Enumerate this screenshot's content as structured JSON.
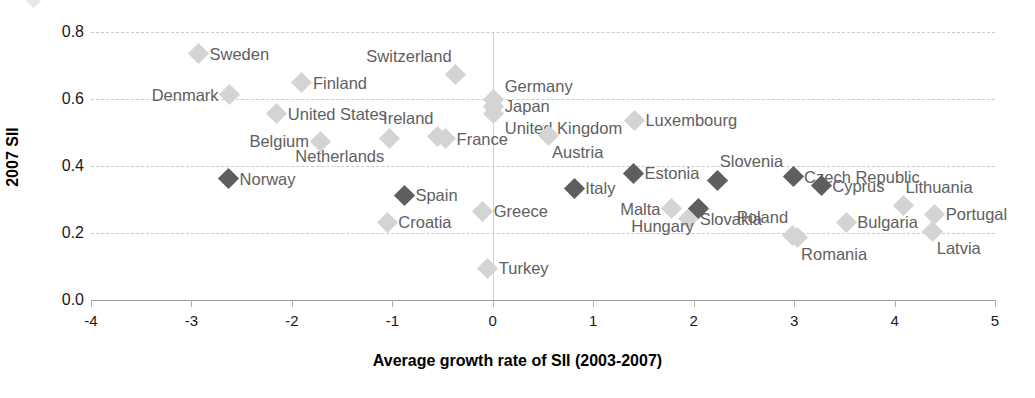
{
  "chart_data": {
    "type": "scatter",
    "title": "",
    "xlabel": "Average growth rate of SII (2003-2007)",
    "ylabel": "2007 SII",
    "xlim": [
      -4,
      5
    ],
    "ylim": [
      0.0,
      0.8
    ],
    "xticks": [
      "-4",
      "-3",
      "-2",
      "-1",
      "0",
      "1",
      "2",
      "3",
      "4",
      "5"
    ],
    "xtick_values": [
      -4,
      -3,
      -2,
      -1,
      0,
      1,
      2,
      3,
      4,
      5
    ],
    "yticks": [
      "0.0",
      "0.2",
      "0.4",
      "0.6",
      "0.8"
    ],
    "ytick_values": [
      0.0,
      0.2,
      0.4,
      0.6,
      0.8
    ],
    "grid": "horizontal-dashed",
    "legend": "none",
    "series": [
      {
        "name": "light-markers",
        "color": "#d4d4d4",
        "points": [
          {
            "label": "Sweden",
            "x": -2.93,
            "y": 0.735,
            "lbl_side": "right"
          },
          {
            "label": "Denmark",
            "x": -2.62,
            "y": 0.612,
            "lbl_side": "left"
          },
          {
            "label": "Finland",
            "x": -1.9,
            "y": 0.648,
            "lbl_side": "right"
          },
          {
            "label": "Switzerland",
            "x": -0.37,
            "y": 0.672,
            "lbl_side": "above-left"
          },
          {
            "label": "Germany",
            "x": 0.01,
            "y": 0.598,
            "lbl_side": "right-up"
          },
          {
            "label": "Japan",
            "x": 0.01,
            "y": 0.578,
            "lbl_side": "right"
          },
          {
            "label": "United Kingdom",
            "x": 0.01,
            "y": 0.558,
            "lbl_side": "right-down"
          },
          {
            "label": "United States",
            "x": -2.15,
            "y": 0.556,
            "lbl_side": "right"
          },
          {
            "label": "Ireland",
            "x": -0.55,
            "y": 0.487,
            "lbl_side": "above-left"
          },
          {
            "label": "France",
            "x": -0.47,
            "y": 0.482,
            "lbl_side": "right"
          },
          {
            "label": "Belgium",
            "x": -1.72,
            "y": 0.474,
            "lbl_side": "left"
          },
          {
            "label": "Netherlands",
            "x": -1.03,
            "y": 0.481,
            "lbl_side": "below-left"
          },
          {
            "label": "Austria",
            "x": 0.55,
            "y": 0.492,
            "lbl_side": "below-right"
          },
          {
            "label": "Luxembourg",
            "x": 1.41,
            "y": 0.536,
            "lbl_side": "right"
          },
          {
            "label": "Greece",
            "x": -0.1,
            "y": 0.265,
            "lbl_side": "right"
          },
          {
            "label": "Croatia",
            "x": -1.05,
            "y": 0.232,
            "lbl_side": "right"
          },
          {
            "label": "Turkey",
            "x": -0.05,
            "y": 0.095,
            "lbl_side": "right"
          },
          {
            "label": "Malta",
            "x": 1.78,
            "y": 0.272,
            "lbl_side": "left"
          },
          {
            "label": "Slovakia",
            "x": 1.95,
            "y": 0.243,
            "lbl_side": "right"
          },
          {
            "label": "Poland",
            "x": 2.98,
            "y": 0.192,
            "lbl_side": "above-left"
          },
          {
            "label": "Romania",
            "x": 3.03,
            "y": 0.188,
            "lbl_side": "below-right"
          },
          {
            "label": "Bulgaria",
            "x": 3.52,
            "y": 0.232,
            "lbl_side": "right"
          },
          {
            "label": "Lithuania",
            "x": 4.09,
            "y": 0.281,
            "lbl_side": "above-right"
          },
          {
            "label": "Portugal",
            "x": 4.4,
            "y": 0.256,
            "lbl_side": "right"
          },
          {
            "label": "Latvia",
            "x": 4.38,
            "y": 0.205,
            "lbl_side": "below-right"
          }
        ]
      },
      {
        "name": "dark-markers",
        "color": "#5e5e5e",
        "points": [
          {
            "label": "Norway",
            "x": -2.63,
            "y": 0.362,
            "lbl_side": "right"
          },
          {
            "label": "Spain",
            "x": -0.88,
            "y": 0.312,
            "lbl_side": "right"
          },
          {
            "label": "Italy",
            "x": 0.81,
            "y": 0.334,
            "lbl_side": "right"
          },
          {
            "label": "Estonia",
            "x": 1.4,
            "y": 0.378,
            "lbl_side": "right"
          },
          {
            "label": "Slovenia",
            "x": 2.24,
            "y": 0.357,
            "lbl_side": "above-right"
          },
          {
            "label": "Hungary",
            "x": 2.05,
            "y": 0.273,
            "lbl_side": "below-left"
          },
          {
            "label": "Czech Republic",
            "x": 2.99,
            "y": 0.368,
            "lbl_side": "right"
          },
          {
            "label": "Cyprus",
            "x": 3.27,
            "y": 0.341,
            "lbl_side": "right"
          }
        ]
      }
    ]
  },
  "axes": {
    "x_title": "Average growth rate of SII (2003-2007)",
    "y_title": "2007 SII"
  }
}
